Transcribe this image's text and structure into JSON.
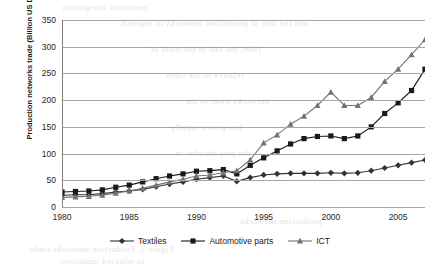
{
  "chart_data": {
    "type": "line",
    "title": "",
    "xlabel": "",
    "ylabel": "Production networks trade (Billion US Dollars)",
    "xlim": [
      1980,
      2007
    ],
    "ylim": [
      0,
      350
    ],
    "ytick_labels": [
      "0",
      "50",
      "100",
      "150",
      "200",
      "250",
      "300",
      "350"
    ],
    "ytick_values": [
      0,
      50,
      100,
      150,
      200,
      250,
      300,
      350
    ],
    "xtick_labels": [
      "1980",
      "1985",
      "1990",
      "1995",
      "2000",
      "2005"
    ],
    "xtick_values": [
      1980,
      1985,
      1990,
      1995,
      2000,
      2005
    ],
    "grid": "horizontal",
    "legend_position": "bottom",
    "x": [
      1980,
      1981,
      1982,
      1983,
      1984,
      1985,
      1986,
      1987,
      1988,
      1989,
      1990,
      1991,
      1992,
      1993,
      1994,
      1995,
      1996,
      1997,
      1998,
      1999,
      2000,
      2001,
      2002,
      2003,
      2004,
      2005,
      2006,
      2007
    ],
    "series": [
      {
        "name": "Textiles",
        "marker": "diamond",
        "color": "#333333",
        "values": [
          22,
          23,
          23,
          25,
          28,
          30,
          33,
          38,
          43,
          47,
          52,
          55,
          58,
          48,
          55,
          60,
          62,
          63,
          63,
          63,
          64,
          63,
          64,
          68,
          73,
          78,
          83,
          88
        ]
      },
      {
        "name": "Automotive parts",
        "marker": "square",
        "color": "#1a1a1a",
        "values": [
          28,
          29,
          30,
          32,
          37,
          41,
          47,
          53,
          58,
          62,
          67,
          68,
          70,
          62,
          78,
          92,
          105,
          118,
          128,
          132,
          133,
          128,
          133,
          150,
          175,
          195,
          218,
          258
        ]
      },
      {
        "name": "ICT",
        "marker": "triangle",
        "color": "#737373",
        "values": [
          18,
          19,
          20,
          22,
          26,
          30,
          35,
          41,
          47,
          52,
          58,
          60,
          64,
          68,
          88,
          120,
          135,
          155,
          170,
          190,
          215,
          190,
          190,
          205,
          235,
          258,
          285,
          313
        ]
      }
    ]
  },
  "artifacts": {
    "bleed_lines": [
      "economic integration",
      "and the role of production networks in regional",
      "1980, the fall in the trade of",
      "relative to the other",
      "networks trade in the",
      "has grown rapidly",
      "the past decades in",
      "production networks",
      "Figure 2. Production networks trade",
      "in selected industries"
    ]
  }
}
